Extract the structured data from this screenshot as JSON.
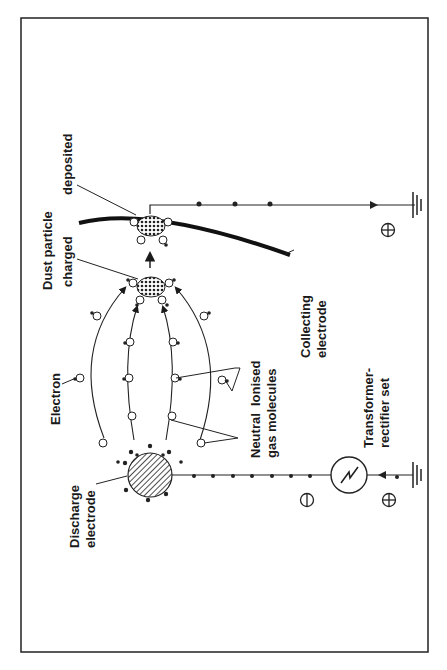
{
  "diagram": {
    "orientation": "rotated 90 degrees counter-clockwise",
    "labels": {
      "dust_particle": "Dust particle",
      "deposited": "deposited",
      "charged": "charged",
      "collecting_electrode_1": "Collecting",
      "collecting_electrode_2": "electrode",
      "electron": "Electron",
      "neutral_ionised_1": "Neutral  Ionised",
      "neutral_ionised_2": "gas molecules",
      "transformer_1": "Transformer-",
      "transformer_2": "rectifier set",
      "discharge_1": "Discharge",
      "discharge_2": "electrode"
    },
    "symbols": {
      "negative": "⊖",
      "positive_supply": "⊕",
      "positive_collector": "⊕"
    },
    "colors": {
      "ink": "#1a1a1a",
      "background": "#ffffff"
    }
  }
}
